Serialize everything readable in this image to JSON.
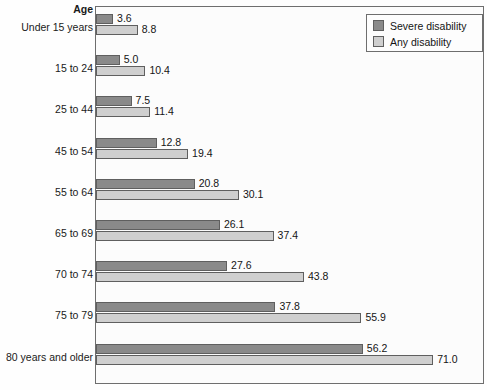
{
  "chart_data": {
    "type": "bar",
    "orientation": "horizontal",
    "title": "",
    "xlabel": "",
    "ylabel": "Age",
    "grid": false,
    "legend_position": "top-right",
    "xlim": [
      0,
      71.0
    ],
    "categories": [
      "Under 15 years",
      "15 to 24",
      "25 to 44",
      "45 to 54",
      "55 to 64",
      "65 to 69",
      "70 to 74",
      "75 to 79",
      "80 years and older"
    ],
    "series": [
      {
        "name": "Severe disability",
        "color": "#8a8a8a",
        "values": [
          3.6,
          5.0,
          7.5,
          12.8,
          20.8,
          26.1,
          27.6,
          37.8,
          56.2
        ],
        "labels": [
          "3.6",
          "5.0",
          "7.5",
          "12.8",
          "20.8",
          "26.1",
          "27.6",
          "37.8",
          "56.2"
        ]
      },
      {
        "name": "Any disability",
        "color": "#cfcfcf",
        "values": [
          8.8,
          10.4,
          11.4,
          19.4,
          30.1,
          37.4,
          43.8,
          55.9,
          71.0
        ],
        "labels": [
          "8.8",
          "10.4",
          "11.4",
          "19.4",
          "30.1",
          "37.4",
          "43.8",
          "55.9",
          "71.0"
        ]
      }
    ]
  },
  "axis": {
    "title": "Age"
  },
  "legend": {
    "entries": [
      {
        "label": "Severe disability"
      },
      {
        "label": "Any disability"
      }
    ]
  }
}
